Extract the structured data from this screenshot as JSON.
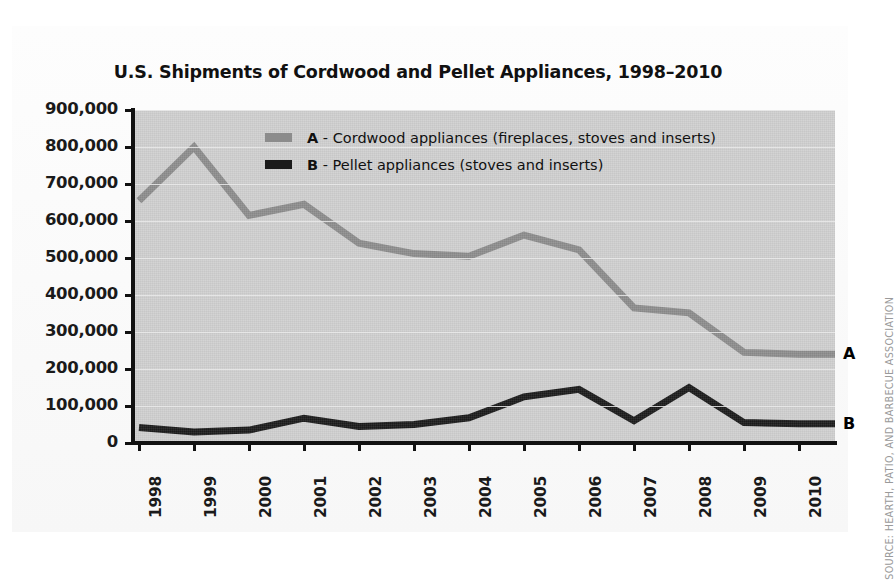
{
  "chart_data": {
    "type": "line",
    "title": "U.S. Shipments of Cordwood and Pellet Appliances, 1998–2010",
    "xlabel": "",
    "ylabel": "",
    "categories": [
      "1998",
      "1999",
      "2000",
      "2001",
      "2002",
      "2003",
      "2004",
      "2005",
      "2006",
      "2007",
      "2008",
      "2009",
      "2010"
    ],
    "ylim": [
      0,
      900000
    ],
    "ytick_labels": [
      "900,000",
      "800,000",
      "700,000",
      "600,000",
      "500,000",
      "400,000",
      "300,000",
      "200,000",
      "100,000",
      "0"
    ],
    "ytick_values": [
      900000,
      800000,
      700000,
      600000,
      500000,
      400000,
      300000,
      200000,
      100000,
      0
    ],
    "grid": true,
    "legend_position": "inside-top-center",
    "series": [
      {
        "name": "A - Cordwood appliances (fireplaces, stoves and inserts)",
        "key": "A",
        "label": "Cordwood appliances (fireplaces, stoves and inserts)",
        "color": "#8c8c8c",
        "end_label": "A",
        "values": [
          655000,
          800000,
          615000,
          645000,
          540000,
          512000,
          505000,
          562000,
          522000,
          365000,
          352000,
          245000,
          240000
        ]
      },
      {
        "name": "B - Pellet appliances (stoves and inserts)",
        "key": "B",
        "label": "Pellet appliances (stoves and inserts)",
        "color": "#1a1a1a",
        "end_label": "B",
        "values": [
          42000,
          30000,
          35000,
          67000,
          45000,
          50000,
          68000,
          125000,
          145000,
          60000,
          150000,
          55000,
          52000
        ]
      }
    ]
  },
  "source_note": "SOURCE: HEARTH, PATIO, AND BARBECUE ASSOCIATION",
  "colors": {
    "plot_background": "#cfcfcf",
    "card_background": "#fbfbfb",
    "axis": "#111111",
    "gridline": "#eaeaea",
    "series_a": "#8c8c8c",
    "series_b": "#1a1a1a",
    "source_text": "#9a9a9a"
  }
}
